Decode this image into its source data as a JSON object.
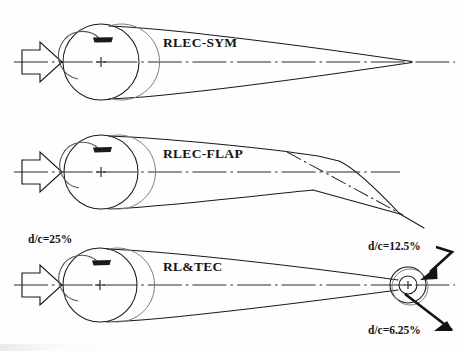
{
  "figure": {
    "type": "technical-diagram",
    "background_color": "#fefefe",
    "line_color": "#1a1a1a",
    "configurations": [
      {
        "id": "rlec-sym",
        "label": "RLEC-SYM",
        "description": "Symmetric airfoil with rotating leading edge cylinder and sharp trailing edge",
        "has_inflow_arrow": true,
        "has_rotation_arrow": true,
        "has_centerline": true,
        "trailing_edge": "sharp-point"
      },
      {
        "id": "rlec-flap",
        "label": "RLEC-FLAP",
        "description": "Airfoil with rotating leading edge cylinder and deflected trailing edge flap",
        "has_inflow_arrow": true,
        "has_rotation_arrow": true,
        "has_centerline": true,
        "has_hinge_line": true,
        "trailing_edge": "deflected-flap"
      },
      {
        "id": "rl-tec",
        "label": "RL&TEC",
        "description": "Airfoil with rotating leading edge cylinder and rotating trailing edge cylinder",
        "has_inflow_arrow": true,
        "has_rotation_arrow": true,
        "has_centerline": true,
        "trailing_edge": "concentric-cylinders"
      }
    ],
    "annotations": [
      {
        "id": "dc-leading-edge",
        "text": "d/c=25%",
        "target": "leading-edge-cylinder",
        "has_arrow": false
      },
      {
        "id": "dc-outer-trailing",
        "text": "d/c=12.5%",
        "target": "outer-trailing-edge-cylinder",
        "has_arrow": true,
        "arrow_direction": "down-left"
      },
      {
        "id": "dc-inner-trailing",
        "text": "d/c=6.25%",
        "target": "inner-trailing-edge-cylinder",
        "has_arrow": true,
        "arrow_direction": "down-right"
      }
    ]
  }
}
